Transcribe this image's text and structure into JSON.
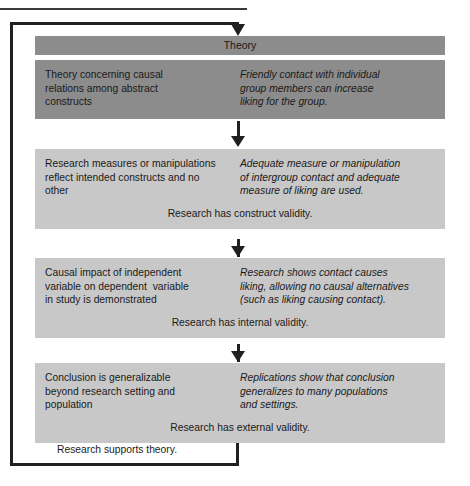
{
  "diagram": {
    "title": "Theory",
    "colors": {
      "dark_box": "#8c8c8c",
      "light_box": "#c8c8c8",
      "line": "#221f1f",
      "text": "#1a1a1a",
      "background": "#ffffff"
    },
    "loop_caption": "Research supports theory.",
    "stages": [
      {
        "id": "theory",
        "header": "Theory",
        "shade": "dark",
        "left_text": "Theory concerning causal\nrelations among abstract\nconstructs",
        "right_text": "Friendly contact with individual\ngroup members can increase\nliking for the group.",
        "validity": null
      },
      {
        "id": "construct-validity",
        "header": null,
        "shade": "light",
        "left_text": "Research measures or manipulations\nreflect intended constructs and no\nother",
        "right_text": "Adequate measure or manipulation\nof intergroup contact and adequate\nmeasure of liking are used.",
        "validity": "Research has construct validity."
      },
      {
        "id": "internal-validity",
        "header": null,
        "shade": "light",
        "left_text": "Causal impact of independent\nvariable on dependent  variable\nin study is demonstrated",
        "right_text": "Research shows contact causes\nliking, allowing no causal alternatives\n(such as liking causing contact).",
        "validity": "Research has internal validity."
      },
      {
        "id": "external-validity",
        "header": null,
        "shade": "light",
        "left_text": "Conclusion is generalizable\nbeyond research setting and\npopulation",
        "right_text": "Replications show that conclusion\ngeneralizes to many populations\nand settings.",
        "validity": "Research has external validity."
      }
    ]
  }
}
